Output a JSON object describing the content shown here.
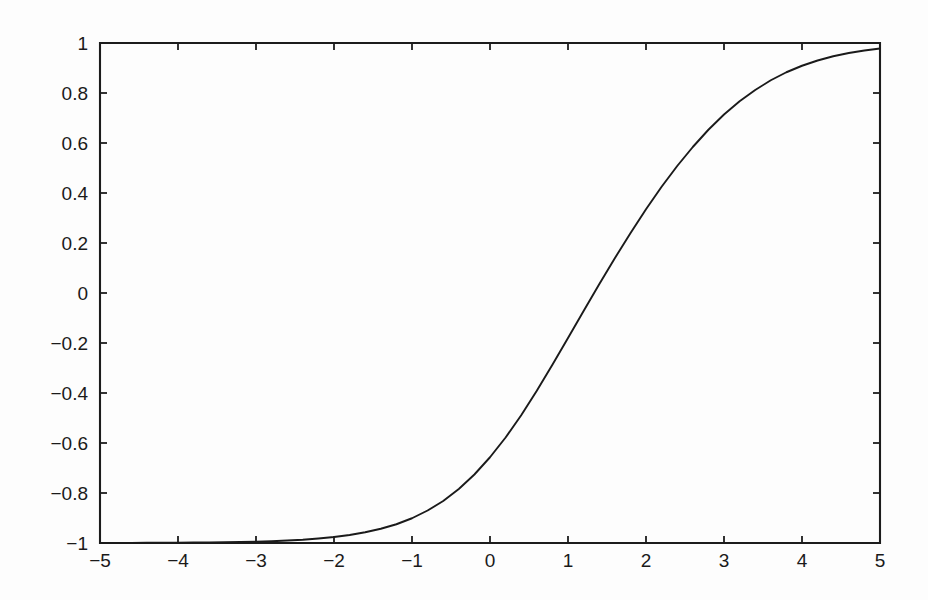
{
  "chart_data": {
    "type": "line",
    "title": "",
    "subtitle": "",
    "xlabel": "",
    "ylabel": "",
    "xlim": [
      -5,
      5
    ],
    "ylim": [
      -1,
      1
    ],
    "grid": false,
    "legend": null,
    "legend_position": "none",
    "annotations": [],
    "background_color": "#fdfdfd",
    "line_color": "#1a1a1a",
    "axis_color": "#1c1c1c",
    "x_ticks": [
      -5,
      -4,
      -3,
      -2,
      -1,
      0,
      1,
      2,
      3,
      4,
      5
    ],
    "x_tick_labels": [
      "-5",
      "-4",
      "-3",
      "-2",
      "-1",
      "0",
      "1",
      "2",
      "3",
      "4",
      "5"
    ],
    "y_ticks": [
      -1,
      -0.8,
      -0.6,
      -0.4,
      -0.2,
      0,
      0.2,
      0.4,
      0.6,
      0.8,
      1
    ],
    "y_tick_labels": [
      "-1",
      "-0.8",
      "-0.6",
      "-0.4",
      "-0.2",
      "0",
      "0.2",
      "0.4",
      "0.6",
      "0.8",
      "1"
    ],
    "tick_direction": "in",
    "series": [
      {
        "name": "sigmoid",
        "x": [
          -5,
          -4.8,
          -4.6,
          -4.4,
          -4.2,
          -4,
          -3.8,
          -3.6,
          -3.4,
          -3.2,
          -3,
          -2.8,
          -2.6,
          -2.4,
          -2.2,
          -2,
          -1.8,
          -1.6,
          -1.4,
          -1.2,
          -1,
          -0.8,
          -0.6,
          -0.4,
          -0.2,
          0,
          0.2,
          0.4,
          0.6,
          0.8,
          1,
          1.2,
          1.4,
          1.6,
          1.8,
          2,
          2.2,
          2.4,
          2.6,
          2.8,
          3,
          3.2,
          3.4,
          3.6,
          3.8,
          4,
          4.2,
          4.4,
          4.6,
          4.8,
          5
        ],
        "y": [
          -1,
          -1,
          -1,
          -0.999,
          -0.999,
          -0.999,
          -0.998,
          -0.998,
          -0.997,
          -0.996,
          -0.995,
          -0.993,
          -0.99,
          -0.987,
          -0.982,
          -0.976,
          -0.968,
          -0.957,
          -0.943,
          -0.925,
          -0.901,
          -0.87,
          -0.832,
          -0.784,
          -0.726,
          -0.657,
          -0.578,
          -0.489,
          -0.391,
          -0.287,
          -0.18,
          -0.072,
          0.035,
          0.139,
          0.239,
          0.335,
          0.425,
          0.508,
          0.584,
          0.653,
          0.714,
          0.767,
          0.812,
          0.851,
          0.883,
          0.909,
          0.93,
          0.947,
          0.96,
          0.97,
          0.978
        ]
      }
    ]
  }
}
